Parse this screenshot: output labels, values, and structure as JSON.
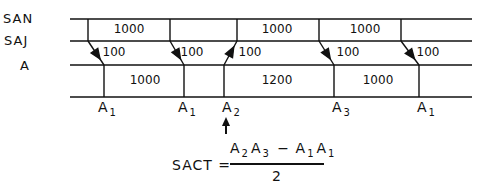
{
  "rows": {
    "san": "SAN",
    "saj": "SAJ",
    "a": "A"
  },
  "san_values": [
    {
      "text": "1000",
      "x": 129
    },
    {
      "text": "1000",
      "x": 277
    },
    {
      "text": "1000",
      "x": 365
    }
  ],
  "saj_values": [
    {
      "text": "100",
      "x": 114
    },
    {
      "text": "100",
      "x": 192
    },
    {
      "text": "100",
      "x": 250
    },
    {
      "text": "100",
      "x": 348
    },
    {
      "text": "100",
      "x": 428
    }
  ],
  "a_values": [
    {
      "text": "1000",
      "x": 145
    },
    {
      "text": "1200",
      "x": 277
    },
    {
      "text": "1000",
      "x": 378
    }
  ],
  "axis_labels": [
    {
      "base": "A",
      "sub": "1",
      "x": 104
    },
    {
      "base": "A",
      "sub": "1",
      "x": 184
    },
    {
      "base": "A",
      "sub": "2",
      "x": 228
    },
    {
      "base": "A",
      "sub": "3",
      "x": 338
    },
    {
      "base": "A",
      "sub": "1",
      "x": 423
    }
  ],
  "transitions": [
    {
      "top_x": 88,
      "bottom_x": 104,
      "direction": "down"
    },
    {
      "top_x": 170,
      "bottom_x": 184,
      "direction": "down"
    },
    {
      "top_x": 237,
      "bottom_x": 224,
      "direction": "up"
    },
    {
      "top_x": 319,
      "bottom_x": 334,
      "direction": "down"
    },
    {
      "top_x": 401,
      "bottom_x": 419,
      "direction": "down"
    }
  ],
  "pointer_arrow": {
    "target": "A2",
    "x": 226
  },
  "formula": {
    "lhs": "SACT =",
    "numerator": {
      "t1_base": "A",
      "t1_sub": "2",
      "t2_base": "A",
      "t2_sub": "3",
      "op": "−",
      "t3_base": "A",
      "t3_sub": "1",
      "t4_base": "A",
      "t4_sub": "1"
    },
    "denominator": "2"
  }
}
